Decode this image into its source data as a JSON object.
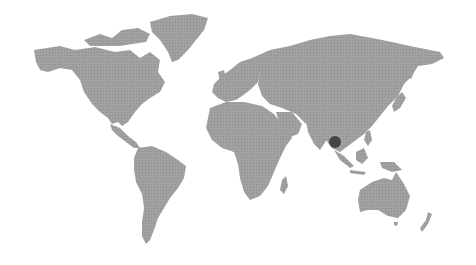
{
  "map": {
    "type": "world-map",
    "land_color": "#9c9c9c",
    "background_color": "#ffffff",
    "marker": {
      "label": "",
      "region": "Southeast Asia (Thailand / Myanmar)",
      "x": 335,
      "y": 142,
      "radius": 6,
      "color": "#444444"
    },
    "regions": [
      "North America",
      "Greenland",
      "South America",
      "Europe",
      "Africa",
      "Asia",
      "Australia",
      "New Zealand"
    ]
  }
}
